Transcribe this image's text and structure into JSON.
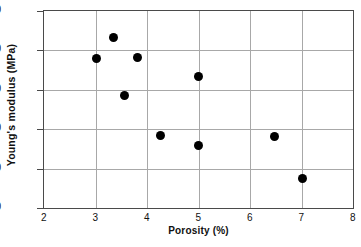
{
  "chart_data": {
    "type": "scatter",
    "title": "",
    "xlabel": "Porosity (%)",
    "ylabel": "Young's modulus  (MPa)",
    "xlim": [
      2,
      8
    ],
    "ylim": [
      30,
      80
    ],
    "xticks": [
      2,
      3,
      4,
      5,
      6,
      7,
      8
    ],
    "yticks": [
      30,
      40,
      50,
      60,
      70,
      80
    ],
    "grid": true,
    "legend": null,
    "marker": {
      "shape": "circle",
      "color": "#000000",
      "size_px": 9
    },
    "points": [
      {
        "x": 3.02,
        "y": 68.0
      },
      {
        "x": 3.34,
        "y": 73.4
      },
      {
        "x": 3.57,
        "y": 58.5
      },
      {
        "x": 3.81,
        "y": 68.3
      },
      {
        "x": 4.26,
        "y": 48.5
      },
      {
        "x": 4.99,
        "y": 63.3
      },
      {
        "x": 5.0,
        "y": 45.9
      },
      {
        "x": 6.47,
        "y": 48.2
      },
      {
        "x": 7.02,
        "y": 37.4
      }
    ],
    "series": [
      {
        "name": "Young's modulus vs porosity",
        "x": [
          3.02,
          3.34,
          3.57,
          3.81,
          4.26,
          4.99,
          5.0,
          6.47,
          7.02
        ],
        "values": [
          68.0,
          73.4,
          58.5,
          68.3,
          48.5,
          63.3,
          45.9,
          48.2,
          37.4
        ]
      }
    ]
  },
  "axes": {
    "x_tick_labels": [
      "2",
      "3",
      "4",
      "5",
      "6",
      "7",
      "8"
    ],
    "y_tick_labels": [
      "30",
      "40",
      "50",
      "60",
      "70",
      "80"
    ],
    "x_axis_title": "Porosity (%)",
    "y_axis_title": "Young's modulus  (MPa)"
  },
  "colors": {
    "marker": "#000000",
    "gridline": "#a8a8a8",
    "frame": "#4a4a4a",
    "background": "#ffffff",
    "text": "#111111"
  }
}
